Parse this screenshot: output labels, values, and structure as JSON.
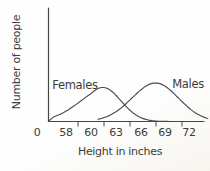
{
  "chart_data": {
    "type": "line",
    "title": "",
    "xlabel": "Height in inches",
    "ylabel": "Number of people",
    "x_tick_labels": [
      "0",
      "58",
      "60",
      "63",
      "66",
      "69",
      "72"
    ],
    "x_tick_values": [
      0,
      58,
      60,
      63,
      66,
      69,
      72
    ],
    "y_axis_numeric": false,
    "grid": false,
    "legend_position": "labels-on-curves",
    "series": [
      {
        "name": "Females",
        "distribution": "normal",
        "mean_inches": 61.4,
        "sd_inches": 2.2,
        "peak_relative_height": 0.885
      },
      {
        "name": "Males",
        "distribution": "normal",
        "mean_inches": 67.8,
        "sd_inches": 2.9,
        "peak_relative_height": 1.0
      }
    ],
    "colors": {
      "curve": "#4a4a4a",
      "axis": "#474747",
      "text": "#3c3c3c",
      "background": "#fdfdfc"
    }
  }
}
